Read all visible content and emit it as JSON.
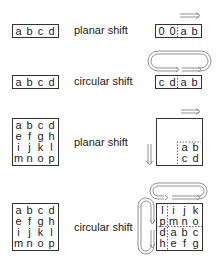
{
  "rows": [
    {
      "label": "planar shift",
      "input": [
        "a",
        "b",
        "c",
        "d"
      ],
      "output": [
        "0",
        "0",
        "a",
        "b"
      ],
      "arrow": "right-arrow"
    },
    {
      "label": "circular shift",
      "input": [
        "a",
        "b",
        "c",
        "d"
      ],
      "output": [
        "c",
        "d",
        "a",
        "b"
      ],
      "arrow": "circular-loop-arrow"
    },
    {
      "label": "planar shift",
      "input": [
        [
          "a",
          "b",
          "c",
          "d"
        ],
        [
          "e",
          "f",
          "g",
          "h"
        ],
        [
          "i",
          "j",
          "k",
          "l"
        ],
        [
          "m",
          "n",
          "o",
          "p"
        ]
      ],
      "output": [
        [
          "",
          "",
          "",
          ""
        ],
        [
          "",
          "",
          "",
          ""
        ],
        [
          "",
          "",
          "a",
          "b"
        ],
        [
          "",
          "",
          "c",
          "d"
        ]
      ],
      "arrows": [
        "right-arrow",
        "down-arrow"
      ]
    },
    {
      "label": "circular shift",
      "input": [
        [
          "a",
          "b",
          "c",
          "d"
        ],
        [
          "e",
          "f",
          "g",
          "h"
        ],
        [
          "i",
          "j",
          "k",
          "l"
        ],
        [
          "m",
          "n",
          "o",
          "p"
        ]
      ],
      "output": [
        [
          "l",
          "i",
          "j",
          "k"
        ],
        [
          "p",
          "m",
          "n",
          "o"
        ],
        [
          "d",
          "a",
          "b",
          "c"
        ],
        [
          "h",
          "e",
          "f",
          "g"
        ]
      ],
      "arrows": [
        "horizontal-loop-arrow",
        "vertical-loop-arrow"
      ]
    }
  ]
}
